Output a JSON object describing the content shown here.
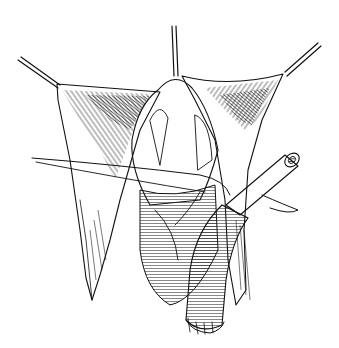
{
  "figure": {
    "alt": "Black-and-white surgical line drawing: retracted tissue flaps held by three retractor instruments, exposing underlying structures, with a suture thread crossing the field and a tubular graft/cannula entering from the right.",
    "colors": {
      "ink": "#111111",
      "background": "#ffffff"
    },
    "elements": [
      "retractor-left",
      "retractor-top",
      "retractor-right",
      "tissue-flap-left",
      "tissue-flap-right",
      "central-structure",
      "suture-thread",
      "tubular-graft",
      "tubular-vessel-lower"
    ]
  }
}
